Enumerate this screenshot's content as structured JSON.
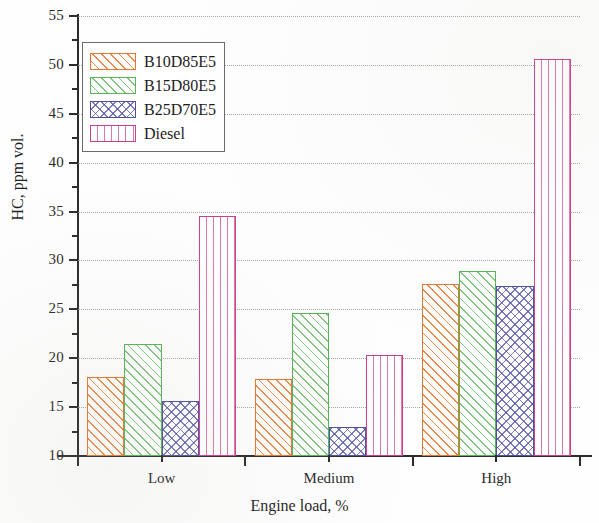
{
  "chart_data": {
    "type": "bar",
    "title": "",
    "xlabel": "Engine load, %",
    "ylabel": "HC, ppm vol.",
    "categories": [
      "Low",
      "Medium",
      "High"
    ],
    "ylim": [
      10,
      55
    ],
    "ytick_step": 5,
    "yticks": [
      "10",
      "15",
      "20",
      "25",
      "30",
      "35",
      "40",
      "45",
      "50",
      "55"
    ],
    "minor_ticks": true,
    "grid": "horizontal-dotted",
    "legend_position": "upper-left-inside",
    "series": [
      {
        "name": "B10D85E5",
        "color": "#e8762c",
        "pattern": "diagonal-hatch",
        "values": [
          18.1,
          17.9,
          27.6
        ]
      },
      {
        "name": "B15D80E5",
        "color": "#56b356",
        "pattern": "diagonal-hatch",
        "values": [
          21.5,
          24.6,
          28.9
        ]
      },
      {
        "name": "B25D70E5",
        "color": "#4f4fa8",
        "pattern": "crosshatch",
        "values": [
          15.6,
          13.0,
          27.4
        ]
      },
      {
        "name": "Diesel",
        "color": "#cf3f8c",
        "pattern": "vertical-lines",
        "values": [
          34.5,
          20.3,
          50.6
        ]
      }
    ]
  }
}
